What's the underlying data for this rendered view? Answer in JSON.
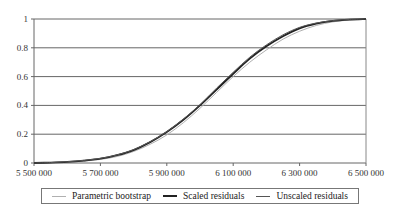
{
  "chart_data": {
    "type": "line",
    "title": "",
    "xlabel": "",
    "ylabel": "",
    "xlim": [
      5500000,
      6500000
    ],
    "ylim": [
      0,
      1
    ],
    "grid": {
      "horizontal": true,
      "vertical": false
    },
    "legend_position": "bottom",
    "x_ticks": [
      5500000,
      5700000,
      5900000,
      6100000,
      6300000,
      6500000
    ],
    "x_tick_labels": [
      "5 500 000",
      "5 700 000",
      "5 900 000",
      "6 100 000",
      "6 300 000",
      "6 500 000"
    ],
    "y_ticks": [
      0,
      0.2,
      0.4,
      0.6,
      0.8,
      1
    ],
    "y_tick_labels": [
      "0",
      "0.2",
      "0.4",
      "0.6",
      "0.8",
      "1"
    ],
    "x": [
      5500000,
      5550000,
      5600000,
      5650000,
      5700000,
      5750000,
      5800000,
      5850000,
      5900000,
      5950000,
      6000000,
      6050000,
      6100000,
      6150000,
      6200000,
      6250000,
      6300000,
      6350000,
      6400000,
      6450000,
      6500000
    ],
    "series": [
      {
        "name": "Parametric bootstrap",
        "color": "#b0b0b0",
        "width": 1,
        "values": [
          0.0,
          0.002,
          0.006,
          0.013,
          0.025,
          0.045,
          0.08,
          0.13,
          0.195,
          0.28,
          0.38,
          0.49,
          0.6,
          0.7,
          0.785,
          0.86,
          0.915,
          0.955,
          0.98,
          0.993,
          1.0
        ]
      },
      {
        "name": "Scaled residuals",
        "color": "#222222",
        "width": 1.8,
        "values": [
          0.0,
          0.003,
          0.008,
          0.017,
          0.03,
          0.054,
          0.09,
          0.145,
          0.215,
          0.3,
          0.4,
          0.51,
          0.62,
          0.725,
          0.81,
          0.88,
          0.935,
          0.968,
          0.987,
          0.996,
          1.0
        ]
      },
      {
        "name": "Unscaled residuals",
        "color": "#555555",
        "width": 1,
        "values": [
          0.0,
          0.003,
          0.009,
          0.018,
          0.032,
          0.056,
          0.093,
          0.148,
          0.218,
          0.305,
          0.405,
          0.52,
          0.63,
          0.735,
          0.82,
          0.89,
          0.942,
          0.972,
          0.989,
          0.997,
          1.0
        ]
      }
    ]
  },
  "legend": {
    "items": [
      {
        "label": "Parametric bootstrap",
        "color": "#b0b0b0",
        "height": "1px"
      },
      {
        "label": "Scaled residuals",
        "color": "#222222",
        "height": "2px"
      },
      {
        "label": "Unscaled residuals",
        "color": "#555555",
        "height": "1px"
      }
    ]
  }
}
